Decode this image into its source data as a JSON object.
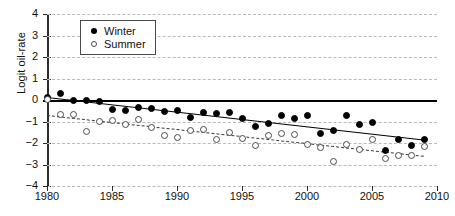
{
  "chart_data": {
    "type": "scatter",
    "title": "",
    "xlabel": "",
    "ylabel": "Logit oil-rate",
    "xlim": [
      1980,
      2010
    ],
    "ylim": [
      -4,
      4
    ],
    "xticks": [
      1980,
      1985,
      1990,
      1995,
      2000,
      2005,
      2010
    ],
    "yticks": [
      -4,
      -3,
      -2,
      -1,
      0,
      1,
      2,
      3,
      4
    ],
    "grid": true,
    "legend_position": "top-left",
    "series": [
      {
        "name": "Winter",
        "marker": "filled-circle",
        "color": "#000000",
        "trendline": "solid",
        "x": [
          1980,
          1981,
          1982,
          1983,
          1984,
          1985,
          1986,
          1987,
          1988,
          1989,
          1990,
          1991,
          1992,
          1993,
          1994,
          1995,
          1996,
          1997,
          1998,
          1999,
          2000,
          2001,
          2002,
          2003,
          2004,
          2005,
          2006,
          2007,
          2008,
          2009
        ],
        "values": [
          0.12,
          0.3,
          0.0,
          0.0,
          -0.05,
          -0.43,
          -0.48,
          -0.33,
          -0.4,
          -0.53,
          -0.5,
          -0.8,
          -0.6,
          -0.63,
          -0.56,
          -0.84,
          -1.21,
          -1.1,
          -0.73,
          -0.86,
          -0.74,
          -1.55,
          -1.43,
          -0.73,
          -1.13,
          -1.06,
          -2.36,
          -1.86,
          -2.12,
          -1.82
        ]
      },
      {
        "name": "Summer",
        "marker": "open-circle",
        "color": "#ffffff",
        "trendline": "dashed",
        "x": [
          1980,
          1981,
          1982,
          1983,
          1984,
          1985,
          1986,
          1987,
          1988,
          1989,
          1990,
          1991,
          1992,
          1993,
          1994,
          1995,
          1996,
          1997,
          1998,
          1999,
          2000,
          2001,
          2002,
          2003,
          2004,
          2005,
          2006,
          2007,
          2008,
          2009
        ],
        "values": [
          0.02,
          -0.68,
          -0.68,
          -1.48,
          -1.0,
          -0.94,
          -1.12,
          -0.9,
          -1.27,
          -1.65,
          -1.75,
          -1.42,
          -1.38,
          -1.84,
          -1.5,
          -1.78,
          -2.12,
          -1.66,
          -1.55,
          -1.61,
          -2.05,
          -2.21,
          -2.87,
          -2.06,
          -2.3,
          -1.82,
          -2.72,
          -2.6,
          -2.6,
          -2.17
        ]
      }
    ],
    "trendlines": [
      {
        "name": "Winter",
        "x0": 1980,
        "y0": 0.12,
        "x1": 2009,
        "y1": -1.86,
        "style": "solid"
      },
      {
        "name": "Summer",
        "x0": 1980,
        "y0": -0.72,
        "x1": 2009,
        "y1": -2.62,
        "style": "dashed"
      }
    ]
  },
  "legend": {
    "items": [
      {
        "label": "Winter",
        "marker": "filled-circle"
      },
      {
        "label": "Summer",
        "marker": "open-circle"
      }
    ]
  }
}
